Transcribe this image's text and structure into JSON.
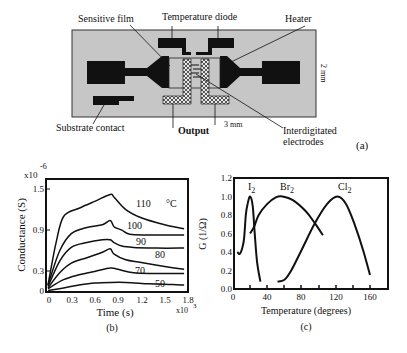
{
  "panel_a": {
    "caption": "(a)",
    "labels": {
      "sensitive_film": "Sensitive film",
      "temperature_diode": "Temperature diode",
      "heater": "Heater",
      "substrate_contact": "Substrate contact",
      "output": "Output",
      "width_dim": "3 mm",
      "height_dim": "2 mm",
      "interdigitated_1": "Interdigitated",
      "interdigitated_2": "electrodes"
    },
    "colors": {
      "substrate": "#c8c8c8",
      "metal": "#111111",
      "hatch": "#cfcfcf"
    }
  },
  "chart_data": [
    {
      "panel": "(b)",
      "type": "line",
      "title": "",
      "xlabel": "Time (s)",
      "ylabel": "Conductance (S)",
      "x_multiplier": "x10^3",
      "y_multiplier": "x10^-6",
      "xlim": [
        0,
        1.8
      ],
      "ylim": [
        0,
        1.6
      ],
      "xticks": [
        "0",
        "0.3",
        "0.6",
        "0.9",
        "1.2",
        "1.5",
        "1.8"
      ],
      "yticks": [
        "0",
        "0.3",
        "0.9",
        "1.5"
      ],
      "grid": false,
      "series": [
        {
          "name": "110 °C",
          "x": [
            0,
            0.1,
            0.2,
            0.4,
            0.6,
            0.8,
            0.85,
            1.0,
            1.2,
            1.5,
            1.75
          ],
          "y": [
            0.1,
            0.7,
            1.1,
            1.22,
            1.32,
            1.42,
            1.38,
            1.2,
            1.08,
            0.98,
            0.92
          ]
        },
        {
          "name": "100",
          "x": [
            0,
            0.15,
            0.3,
            0.5,
            0.7,
            0.8,
            0.85,
            0.95,
            1.05,
            1.3,
            1.75
          ],
          "y": [
            0.1,
            0.6,
            0.85,
            0.94,
            0.98,
            1.04,
            0.95,
            0.9,
            0.84,
            0.83,
            0.83
          ]
        },
        {
          "name": "90",
          "x": [
            0,
            0.15,
            0.3,
            0.5,
            0.7,
            0.8,
            0.85,
            0.95,
            1.1,
            1.4,
            1.75
          ],
          "y": [
            0.08,
            0.45,
            0.65,
            0.72,
            0.76,
            0.76,
            0.72,
            0.67,
            0.65,
            0.64,
            0.64
          ]
        },
        {
          "name": "80",
          "x": [
            0,
            0.15,
            0.3,
            0.5,
            0.7,
            0.8,
            0.85,
            1.0,
            1.2,
            1.5,
            1.75
          ],
          "y": [
            0.06,
            0.28,
            0.42,
            0.5,
            0.58,
            0.63,
            0.55,
            0.47,
            0.43,
            0.37,
            0.33
          ]
        },
        {
          "name": "70",
          "x": [
            0,
            0.2,
            0.4,
            0.6,
            0.8,
            0.9,
            1.1,
            1.4,
            1.75
          ],
          "y": [
            0.05,
            0.18,
            0.25,
            0.3,
            0.35,
            0.33,
            0.28,
            0.27,
            0.27
          ]
        },
        {
          "name": "50",
          "x": [
            0,
            0.2,
            0.4,
            0.6,
            0.8,
            1.0,
            1.3,
            1.6,
            1.75
          ],
          "y": [
            0.02,
            0.06,
            0.1,
            0.13,
            0.14,
            0.14,
            0.12,
            0.11,
            0.1
          ]
        }
      ]
    },
    {
      "panel": "(c)",
      "type": "line",
      "title": "",
      "xlabel": "Temperature (degrees)",
      "ylabel": "G (1/Ω)",
      "xlim": [
        0,
        180
      ],
      "ylim": [
        0,
        1.2
      ],
      "xticks": [
        "0",
        "40",
        "80",
        "120",
        "160"
      ],
      "yticks": [
        "0.0",
        "0.2",
        "0.4",
        "0.6",
        "0.8",
        "1.0",
        "1.2"
      ],
      "grid": false,
      "series": [
        {
          "name": "I2",
          "x": [
            5,
            8,
            11,
            13,
            15,
            17,
            20,
            23,
            25,
            28,
            32
          ],
          "y": [
            0.4,
            0.38,
            0.45,
            0.55,
            0.8,
            0.92,
            1.0,
            0.9,
            0.65,
            0.3,
            0.08
          ]
        },
        {
          "name": "Br2",
          "x": [
            20,
            25,
            30,
            40,
            50,
            58,
            70,
            85,
            95,
            105
          ],
          "y": [
            0.6,
            0.68,
            0.8,
            0.92,
            0.99,
            1.0,
            0.96,
            0.84,
            0.72,
            0.58
          ]
        },
        {
          "name": "Cl2",
          "x": [
            52,
            60,
            68,
            80,
            95,
            110,
            122,
            132,
            142,
            152,
            160
          ],
          "y": [
            0.08,
            0.1,
            0.2,
            0.42,
            0.7,
            0.92,
            1.0,
            0.92,
            0.7,
            0.42,
            0.15
          ]
        }
      ]
    }
  ],
  "panel_b": {
    "caption": "(b)",
    "y_exp_base": "x10",
    "y_exp": "-6",
    "x_exp_base": "x10",
    "x_exp": "3",
    "ylabel": "Conductance (S)",
    "xlabel": "Time (s)",
    "xticks": [
      "0",
      "0.3",
      "0.6",
      "0.9",
      "1.2",
      "1.5",
      "1.8"
    ],
    "yticks": [
      "0",
      "0.3",
      "0.9",
      "1.5"
    ],
    "curve_labels": [
      "110",
      "°C",
      "100",
      "90",
      "80",
      "70",
      "50"
    ]
  },
  "panel_c": {
    "caption": "(c)",
    "ylabel": "G (1/Ω)",
    "xlabel": "Temperature (degrees)",
    "xticks": [
      "0",
      "40",
      "80",
      "120",
      "160"
    ],
    "yticks": [
      "0.0",
      "0.2",
      "0.4",
      "0.6",
      "0.8",
      "1.0",
      "1.2"
    ],
    "series_labels": {
      "I": "I",
      "Br": "Br",
      "Cl": "Cl",
      "sub": "2"
    }
  }
}
